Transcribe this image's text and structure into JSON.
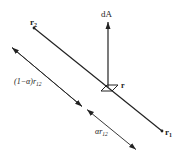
{
  "diagram": {
    "type": "vector-geometry",
    "colors": {
      "stroke": "#222222",
      "background": "#ffffff"
    },
    "points": {
      "r2": {
        "label": "r",
        "subscript": "2",
        "x": 34,
        "y": 28
      },
      "r1": {
        "label": "r",
        "subscript": "1",
        "x": 162,
        "y": 131
      },
      "r": {
        "label": "r",
        "x": 110,
        "y": 87
      }
    },
    "vector": {
      "label": "dA",
      "from": [
        108,
        87
      ],
      "to": [
        108,
        20
      ]
    },
    "surface_element": {
      "label": "area-element"
    },
    "dimension_line": {
      "from": [
        10,
        46
      ],
      "to": [
        137,
        150
      ],
      "split": [
        84,
        108
      ],
      "upper_label": {
        "prefix": "(1−α)r",
        "subscript": "12"
      },
      "lower_label": {
        "prefix": "αr",
        "subscript": "12"
      }
    }
  }
}
